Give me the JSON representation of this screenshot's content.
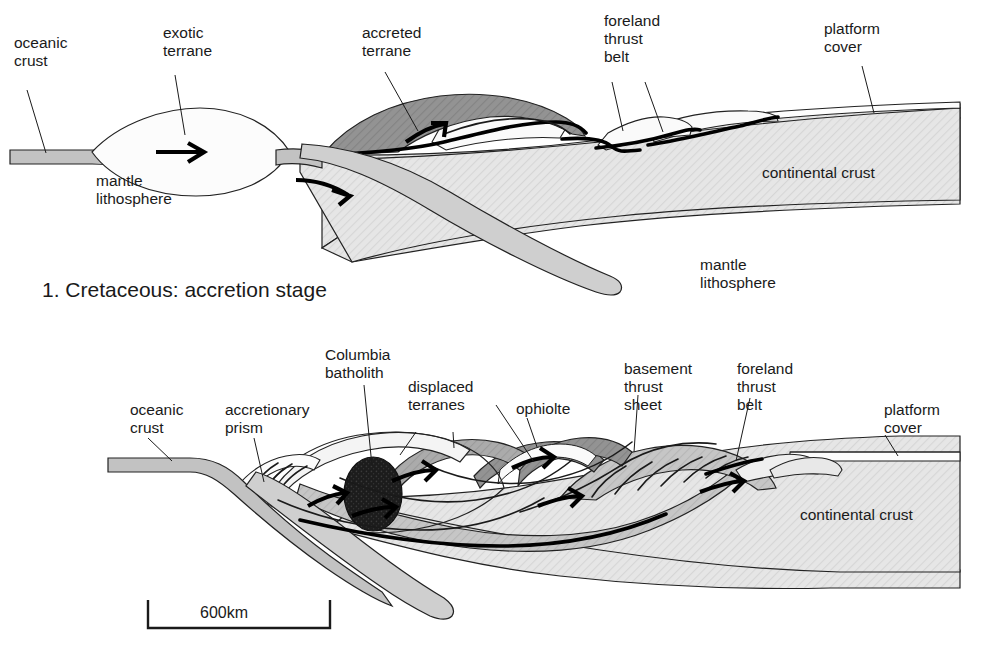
{
  "figure": {
    "title_panel_1": "1. Cretaceous: accretion stage",
    "scale_bar_label": "600km"
  },
  "panel_top": {
    "name": "Cretaceous accretion stage cross-section",
    "labels": {
      "oceanic_crust_l1": "oceanic",
      "oceanic_crust_l2": "crust",
      "exotic_terrane_l1": "exotic",
      "exotic_terrane_l2": "terrane",
      "mantle_lithosphere_left_l1": "mantle",
      "mantle_lithosphere_left_l2": "lithosphere",
      "accreted_terrane_l1": "accreted",
      "accreted_terrane_l2": "terrane",
      "foreland_thrust_belt_l1": "foreland",
      "foreland_thrust_belt_l2": "thrust",
      "foreland_thrust_belt_l3": "belt",
      "platform_cover_l1": "platform",
      "platform_cover_l2": "cover",
      "continental_crust": "continental crust",
      "mantle_lithosphere_right_l1": "mantle",
      "mantle_lithosphere_right_l2": "lithosphere"
    }
  },
  "panel_bottom": {
    "name": "Later collision stage cross-section",
    "labels": {
      "oceanic_crust_l1": "oceanic",
      "oceanic_crust_l2": "crust",
      "accretionary_prism_l1": "accretionary",
      "accretionary_prism_l2": "prism",
      "columbia_batholith_l1": "Columbia",
      "columbia_batholith_l2": "batholith",
      "displaced_terranes_l1": "displaced",
      "displaced_terranes_l2": "terranes",
      "ophiolite": "ophiolte",
      "basement_thrust_sheet_l1": "basement",
      "basement_thrust_sheet_l2": "thrust",
      "basement_thrust_sheet_l3": "sheet",
      "foreland_thrust_belt_l1": "foreland",
      "foreland_thrust_belt_l2": "thrust",
      "foreland_thrust_belt_l3": "belt",
      "platform_cover_l1": "platform",
      "platform_cover_l2": "cover",
      "continental_crust": "continental crust"
    }
  },
  "colors": {
    "background": "#ffffff",
    "stroke": "#1a1a1a",
    "fill_white": "#fdfdfd",
    "fill_very_light": "#f2f2f2",
    "fill_light_hatch": "#e3e3e3",
    "fill_mid": "#c2c2c2",
    "fill_mid_dark": "#a8a8a8",
    "fill_dark": "#8f8f8f",
    "fill_black": "#1c1c1c"
  }
}
